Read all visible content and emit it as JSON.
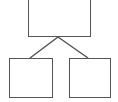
{
  "diagram": {
    "type": "tree",
    "background": "#ffffff",
    "stroke_color": "#555555",
    "nodes": [
      {
        "id": "root",
        "label": "",
        "level": 0
      },
      {
        "id": "left-child",
        "label": "",
        "level": 1
      },
      {
        "id": "right-child",
        "label": "",
        "level": 1
      }
    ],
    "edges": [
      {
        "from": "root",
        "to": "left-child"
      },
      {
        "from": "root",
        "to": "right-child"
      }
    ]
  }
}
